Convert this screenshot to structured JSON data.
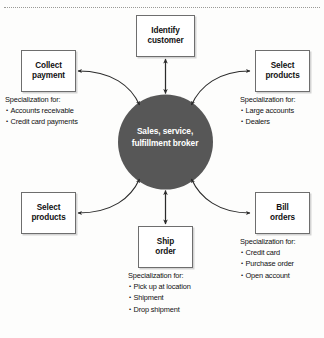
{
  "diagram": {
    "hub": {
      "name": "hub-node",
      "line1": "Sales, service,",
      "line2": "fulfillment broker",
      "fill_color": "#575757",
      "text_color": "#ffffff"
    },
    "nodes": [
      {
        "id": "identify-customer",
        "line1": "Identify",
        "line2": "customer",
        "position": "top"
      },
      {
        "id": "collect-payment",
        "line1": "Collect",
        "line2": "payment",
        "position": "top-left"
      },
      {
        "id": "select-products-top-right",
        "line1": "Select",
        "line2": "products",
        "position": "top-right"
      },
      {
        "id": "select-products-bottom-left",
        "line1": "Select",
        "line2": "products",
        "position": "bottom-left"
      },
      {
        "id": "bill-orders",
        "line1": "Bill",
        "line2": "orders",
        "position": "bottom-right"
      },
      {
        "id": "ship-order",
        "line1": "Ship",
        "line2": "order",
        "position": "bottom"
      }
    ],
    "specializations": [
      {
        "id": "collect-payment-spec",
        "heading": "Specialization for:",
        "items": [
          "Accounts receivable",
          "Credit card payments"
        ]
      },
      {
        "id": "select-products-top-right-spec",
        "heading": "Specialization for:",
        "items": [
          "Large accounts",
          "Dealers"
        ]
      },
      {
        "id": "bill-orders-spec",
        "heading": "Specialization for:",
        "items": [
          "Credit card",
          "Purchase order",
          "Open account"
        ]
      },
      {
        "id": "ship-order-spec",
        "heading": "Specialization for:",
        "items": [
          "Pick up at location",
          "Shipment",
          "Drop shipment"
        ]
      }
    ],
    "connectors": {
      "style": "double-headed-arrow",
      "color": "#2b2b2b",
      "count": 6
    }
  },
  "caption": {
    "text": ""
  }
}
